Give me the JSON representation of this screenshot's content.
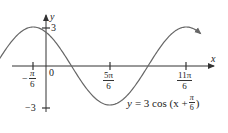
{
  "chart_data": {
    "type": "line",
    "title": "",
    "function": "y = 3 cos (x + π/6)",
    "amplitude": 3,
    "phase_shift": "-π/6",
    "period": "2π",
    "xlabel": "x",
    "ylabel": "y",
    "x_ticks": [
      {
        "value": "-π/6",
        "numeric": -0.5236
      },
      {
        "value": "0",
        "numeric": 0
      },
      {
        "value": "5π/6",
        "numeric": 2.618
      },
      {
        "value": "11π/6",
        "numeric": 5.7596
      }
    ],
    "y_ticks": [
      {
        "value": "3",
        "numeric": 3
      },
      {
        "value": "-3",
        "numeric": -3
      }
    ],
    "xlim": [
      -2.6,
      6.4
    ],
    "ylim": [
      -3.5,
      4
    ],
    "key_points": [
      {
        "x": "-π/6",
        "y": 3
      },
      {
        "x": "π/3",
        "y": 0
      },
      {
        "x": "5π/6",
        "y": -3
      },
      {
        "x": "4π/3",
        "y": 0
      },
      {
        "x": "11π/6",
        "y": 3
      }
    ],
    "grid": false,
    "legend": null,
    "curve_color": "#666666",
    "axis_color": "#333333"
  },
  "labels": {
    "y_axis": "y",
    "x_axis": "x",
    "y_max": "3",
    "y_min": "−3",
    "origin": "0",
    "tick_neg_pi6_sign": "−",
    "tick_neg_pi6_num": "π",
    "tick_neg_pi6_den": "6",
    "tick_5pi6_num": "5π",
    "tick_5pi6_den": "6",
    "tick_11pi6_num": "11π",
    "tick_11pi6_den": "6"
  },
  "equation": {
    "lhs": "y",
    "rhs_prefix": "= 3 cos (x +",
    "frac_num": "π",
    "frac_den": "6",
    "rhs_suffix": ")"
  }
}
